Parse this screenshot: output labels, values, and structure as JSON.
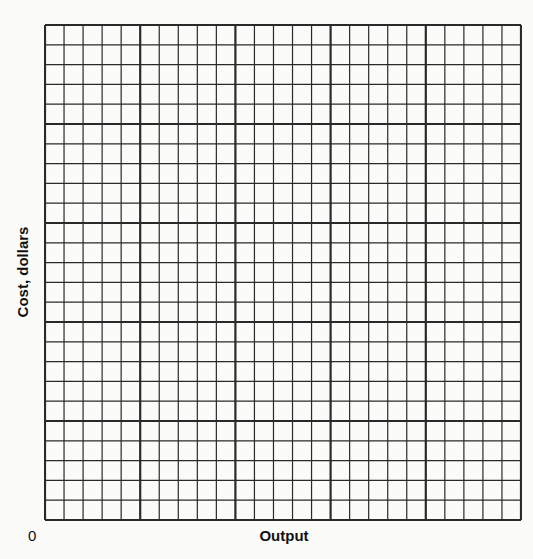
{
  "chart_data": {
    "type": "line",
    "title": "",
    "xlabel": "Output",
    "ylabel": "Cost, dollars",
    "origin_label": "0",
    "series": [],
    "grid": {
      "on": true,
      "major_divisions_x": 5,
      "major_divisions_y": 5,
      "minor_per_major": 5,
      "total_cells_x": 25,
      "total_cells_y": 25
    },
    "axis_ticks_x": [],
    "axis_ticks_y": [],
    "legend": null,
    "colors": {
      "grid_line": "#2a2a2a",
      "background": "#fbfbf9"
    }
  }
}
